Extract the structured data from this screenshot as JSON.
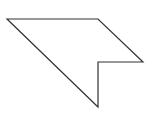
{
  "diagram": {
    "type": "polygon",
    "shape": "arrowhead-like pentagon",
    "stroke_color": "#333333",
    "fill_color": "#ffffff",
    "points": "7,19 98,19 143,62 98,62 98,107"
  }
}
